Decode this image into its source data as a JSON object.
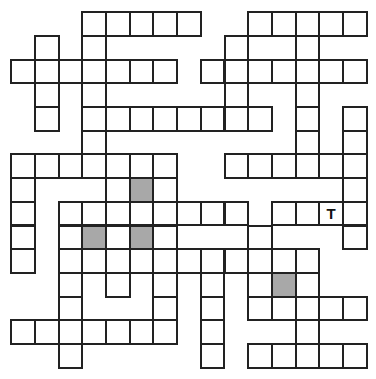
{
  "puzzle": {
    "rows": 15,
    "cols": 15,
    "colors": {
      "line": "#222222",
      "cell": "#ffffff",
      "shaded": "#a8a8a8",
      "letter": "#111111"
    },
    "cells_by_row": [
      [
        3,
        4,
        5,
        6,
        7,
        10,
        11,
        12,
        13,
        14
      ],
      [
        1,
        3,
        9,
        12
      ],
      [
        0,
        1,
        2,
        3,
        4,
        5,
        6,
        8,
        9,
        10,
        11,
        12,
        13,
        14
      ],
      [
        1,
        3,
        9,
        12
      ],
      [
        1,
        3,
        4,
        5,
        6,
        7,
        8,
        9,
        10,
        12,
        14
      ],
      [
        3,
        12,
        14
      ],
      [
        0,
        1,
        2,
        3,
        4,
        5,
        6,
        9,
        10,
        11,
        12,
        13,
        14
      ],
      [
        0,
        4,
        5,
        6,
        14
      ],
      [
        0,
        2,
        3,
        4,
        5,
        6,
        7,
        8,
        9,
        11,
        12,
        13,
        14
      ],
      [
        0,
        2,
        3,
        4,
        5,
        6,
        10,
        14
      ],
      [
        0,
        2,
        3,
        4,
        5,
        6,
        7,
        8,
        9,
        10,
        11,
        12
      ],
      [
        2,
        4,
        6,
        8,
        10,
        11,
        12
      ],
      [
        2,
        6,
        8,
        10,
        11,
        12,
        13,
        14
      ],
      [
        0,
        1,
        2,
        3,
        4,
        5,
        6,
        8,
        12
      ],
      [
        2,
        8,
        10,
        11,
        12,
        13,
        14
      ]
    ],
    "shaded": [
      [
        7,
        5
      ],
      [
        9,
        3
      ],
      [
        9,
        5
      ],
      [
        11,
        11
      ]
    ],
    "letters": [
      {
        "row": 8,
        "col": 13,
        "value": "T"
      }
    ]
  }
}
